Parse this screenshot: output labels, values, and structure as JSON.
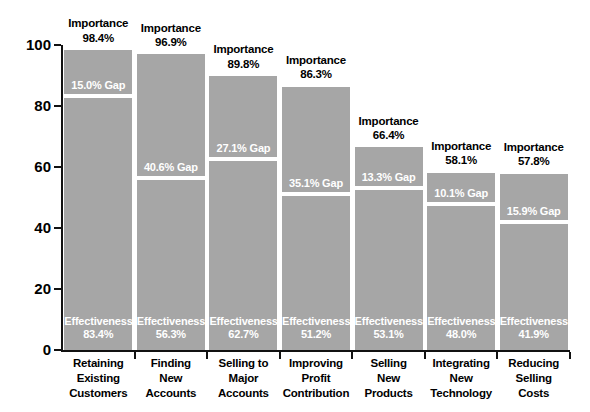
{
  "chart_data": {
    "type": "bar",
    "title": "",
    "subtitle": "",
    "xlabel": "",
    "ylabel": "",
    "ylim": [
      0,
      100
    ],
    "grid": false,
    "legend_position": "none",
    "y_ticks": [
      0,
      20,
      40,
      60,
      80,
      100
    ],
    "y_tick_labels": [
      "0",
      "20",
      "40",
      "60",
      "80",
      "100"
    ],
    "categories": [
      "Retaining Existing Customers",
      "Finding New Accounts",
      "Selling to Major Accounts",
      "Improving Profit Contribution",
      "Selling New Products",
      "Integrating New Technology",
      "Reducing Selling Costs"
    ],
    "category_lines": [
      [
        "Retaining",
        "Existing",
        "Customers"
      ],
      [
        "Finding",
        "New",
        "Accounts"
      ],
      [
        "Selling to",
        "Major",
        "Accounts"
      ],
      [
        "Improving",
        "Profit",
        "Contribution"
      ],
      [
        "Selling",
        "New",
        "Products"
      ],
      [
        "Integrating",
        "New",
        "Technology"
      ],
      [
        "Reducing",
        "Selling",
        "Costs"
      ]
    ],
    "series": [
      {
        "name": "Importance",
        "values": [
          98.4,
          96.9,
          89.8,
          86.3,
          66.4,
          58.1,
          57.8
        ]
      },
      {
        "name": "Effectiveness",
        "values": [
          83.4,
          56.3,
          62.7,
          51.2,
          53.1,
          48.0,
          41.9
        ]
      },
      {
        "name": "Gap",
        "values": [
          15.0,
          40.6,
          27.1,
          35.1,
          13.3,
          10.1,
          15.9
        ]
      }
    ],
    "bar_color": "#a6a6a6",
    "gap_line_color": "#ffffff",
    "axis_color": "#111111",
    "label_text_color": "#ffffff",
    "annotation_text_color": "#000000",
    "bars": [
      {
        "category_lines": [
          "Retaining",
          "Existing",
          "Customers"
        ],
        "importance_title": "Importance",
        "importance_value": "98.4%",
        "gap_label": "15.0% Gap",
        "effectiveness_title": "Effectiveness",
        "effectiveness_value": "83.4%",
        "importance": 98.4,
        "effectiveness": 83.4,
        "gap": 15.0
      },
      {
        "category_lines": [
          "Finding",
          "New",
          "Accounts"
        ],
        "importance_title": "Importance",
        "importance_value": "96.9%",
        "gap_label": "40.6% Gap",
        "effectiveness_title": "Effectiveness",
        "effectiveness_value": "56.3%",
        "importance": 96.9,
        "effectiveness": 56.3,
        "gap": 40.6
      },
      {
        "category_lines": [
          "Selling to",
          "Major",
          "Accounts"
        ],
        "importance_title": "Importance",
        "importance_value": "89.8%",
        "gap_label": "27.1% Gap",
        "effectiveness_title": "Effectiveness",
        "effectiveness_value": "62.7%",
        "importance": 89.8,
        "effectiveness": 62.7,
        "gap": 27.1
      },
      {
        "category_lines": [
          "Improving",
          "Profit",
          "Contribution"
        ],
        "importance_title": "Importance",
        "importance_value": "86.3%",
        "gap_label": "35.1% Gap",
        "effectiveness_title": "Effectiveness",
        "effectiveness_value": "51.2%",
        "importance": 86.3,
        "effectiveness": 51.2,
        "gap": 35.1
      },
      {
        "category_lines": [
          "Selling",
          "New",
          "Products"
        ],
        "importance_title": "Importance",
        "importance_value": "66.4%",
        "gap_label": "13.3% Gap",
        "effectiveness_title": "Effectiveness",
        "effectiveness_value": "53.1%",
        "importance": 66.4,
        "effectiveness": 53.1,
        "gap": 13.3
      },
      {
        "category_lines": [
          "Integrating",
          "New",
          "Technology"
        ],
        "importance_title": "Importance",
        "importance_value": "58.1%",
        "gap_label": "10.1% Gap",
        "effectiveness_title": "Effectiveness",
        "effectiveness_value": "48.0%",
        "importance": 58.1,
        "effectiveness": 48.0,
        "gap": 10.1
      },
      {
        "category_lines": [
          "Reducing",
          "Selling",
          "Costs"
        ],
        "importance_title": "Importance",
        "importance_value": "57.8%",
        "gap_label": "15.9% Gap",
        "effectiveness_title": "Effectiveness",
        "effectiveness_value": "41.9%",
        "importance": 57.8,
        "effectiveness": 41.9,
        "gap": 15.9
      }
    ]
  }
}
